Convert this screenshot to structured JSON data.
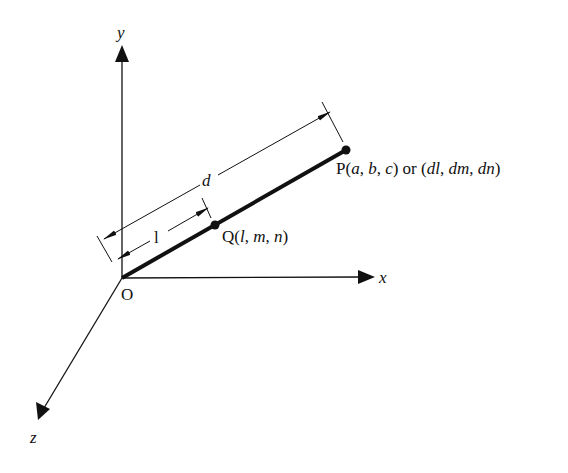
{
  "diagram": {
    "type": "3d-coordinate-vector",
    "axes": {
      "x_label": "x",
      "y_label": "y",
      "z_label": "z",
      "origin_label": "O"
    },
    "points": {
      "P": {
        "name": "P",
        "label_parts": [
          "P(",
          "a",
          ", ",
          "b",
          ", ",
          "c",
          ") or (",
          "dl",
          ", ",
          "dm",
          ", ",
          "dn",
          ")"
        ]
      },
      "Q": {
        "name": "Q",
        "label_parts": [
          "Q(",
          "l",
          ", ",
          "m",
          ", ",
          "n",
          ")"
        ]
      }
    },
    "dimensions": {
      "long_label": "d",
      "short_label": "l"
    },
    "colors": {
      "ink": "#111111",
      "background": "#ffffff"
    }
  }
}
